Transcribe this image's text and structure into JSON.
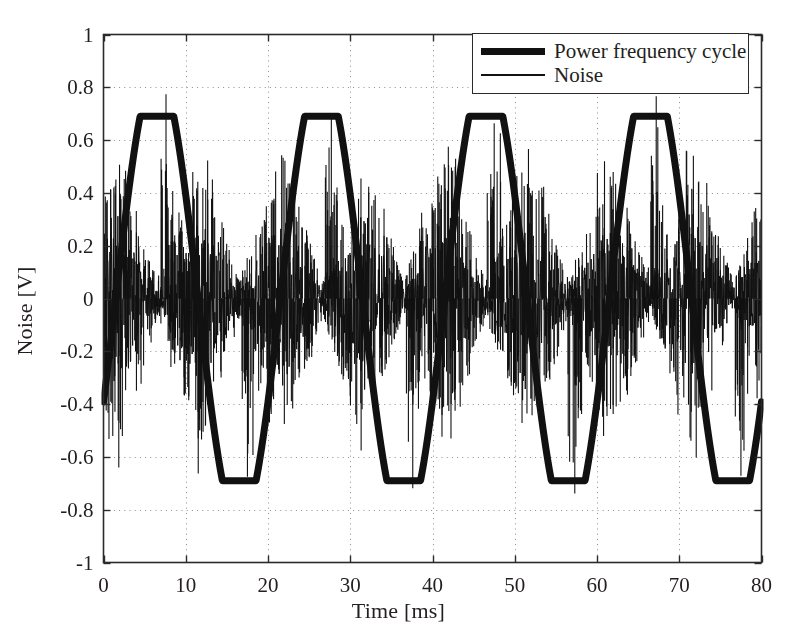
{
  "chart_data": {
    "type": "line",
    "title": "",
    "xlabel": "Time [ms]",
    "ylabel": "Noise [V]",
    "xlim": [
      0,
      80
    ],
    "ylim": [
      -1,
      1
    ],
    "xticks": [
      "0",
      "10",
      "20",
      "30",
      "40",
      "50",
      "60",
      "70",
      "80"
    ],
    "xtick_values": [
      0,
      10,
      20,
      30,
      40,
      50,
      60,
      70,
      80
    ],
    "yticks": [
      "1",
      "0.8",
      "0.6",
      "0.4",
      "0.2",
      "0",
      "-0.2",
      "-0.4",
      "-0.6",
      "-0.8",
      "-1"
    ],
    "ytick_values": [
      1,
      0.8,
      0.6,
      0.4,
      0.2,
      0,
      -0.2,
      -0.4,
      -0.6,
      -0.8,
      -1
    ],
    "grid": true,
    "grid_style": "dotted",
    "legend_position": "top-right",
    "background_color": "#ffffff",
    "axis_color": "#2b2b2b",
    "series": [
      {
        "name": "Power frequency cycle",
        "style": "thick-line",
        "color": "#111111",
        "line_width": 7,
        "waveform": "clipped-sine",
        "amplitude": 0.69,
        "period_ms": 20,
        "phase_offset_ms": 1.5,
        "clip_level": 0.69,
        "peak_times_ms": [
          6.5,
          26.5,
          46.5,
          66.5
        ],
        "peak_value": 0.69,
        "trough_times_ms": [
          16.8,
          36.8,
          56.8,
          76.8
        ],
        "trough_value": -0.69,
        "zero_crossing_times_ms": [
          1.6,
          11.6,
          21.6,
          31.6,
          41.6,
          51.6,
          61.6,
          71.6
        ]
      },
      {
        "name": "Noise",
        "style": "thin-line",
        "color": "#111111",
        "line_width": 1,
        "waveform": "amplitude-modulated-random",
        "envelope_shape": "diamond",
        "envelope_period_ms": 10,
        "envelope_peak_times_ms": [
          1.6,
          11.6,
          21.6,
          31.6,
          41.6,
          51.6,
          61.6,
          71.6
        ],
        "envelope_peak_amplitude": 0.42,
        "envelope_min_amplitude": 0.05,
        "max_spike_value": 0.78,
        "min_spike_value": -0.76,
        "spike_times_ms": [
          7.6,
          17.5,
          27.7,
          37.6,
          47.5,
          57.3,
          67.2,
          77.5
        ],
        "carrier_rate_khz": 40
      }
    ]
  },
  "legend": {
    "entries": [
      {
        "label": "Power frequency cycle",
        "sample": "thick"
      },
      {
        "label": "Noise",
        "sample": "thin"
      }
    ]
  },
  "axes": {
    "x_title": "Time [ms]",
    "y_title": "Noise [V]"
  }
}
